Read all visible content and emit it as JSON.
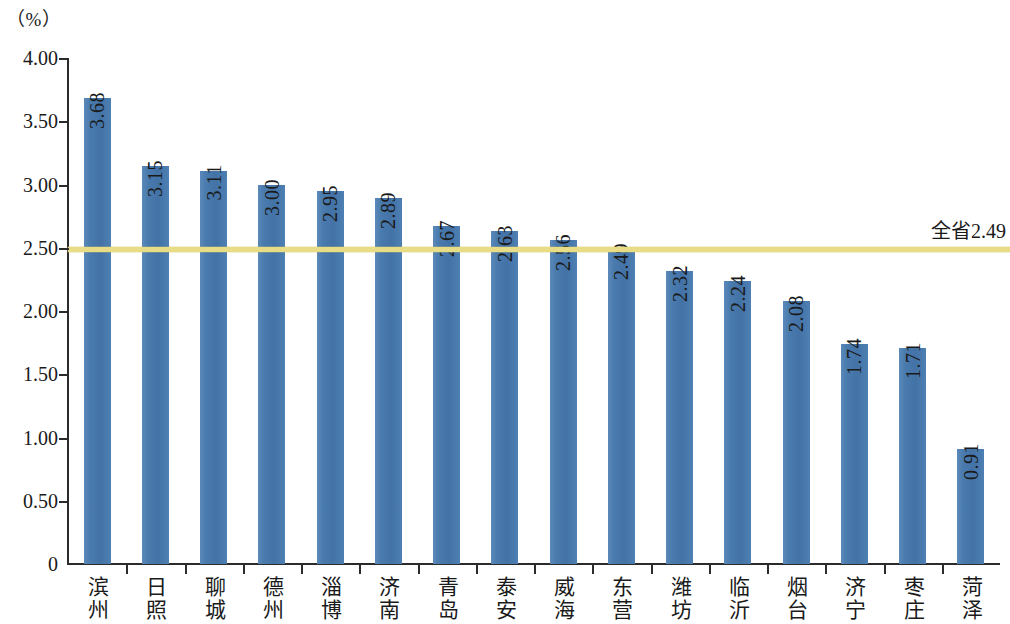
{
  "unit_label": "（%）",
  "average_line": {
    "label": "全省2.49",
    "value": 2.49,
    "color": "#e9dc86"
  },
  "axis": {
    "y_ticks": [
      "4.00",
      "3.50",
      "3.00",
      "2.50",
      "2.00",
      "1.50",
      "1.00",
      "0.50",
      "0"
    ],
    "y_values": [
      4.0,
      3.5,
      3.0,
      2.5,
      2.0,
      1.5,
      1.0,
      0.5,
      0
    ]
  },
  "chart_data": {
    "type": "bar",
    "title": "",
    "subtitle": "",
    "xlabel": "",
    "ylabel": "（%）",
    "ylim": [
      0,
      4.0
    ],
    "ytick_values": [
      0,
      0.5,
      1.0,
      1.5,
      2.0,
      2.5,
      3.0,
      3.5,
      4.0
    ],
    "ytick_labels": [
      "0",
      "0.50",
      "1.00",
      "1.50",
      "2.00",
      "2.50",
      "3.00",
      "3.50",
      "4.00"
    ],
    "grid": false,
    "legend": null,
    "bar_color": "#4a7bae",
    "categories": [
      "滨州",
      "日照",
      "聊城",
      "德州",
      "淄博",
      "济南",
      "青岛",
      "泰安",
      "威海",
      "东营",
      "潍坊",
      "临沂",
      "烟台",
      "济宁",
      "枣庄",
      "菏泽"
    ],
    "values": [
      3.68,
      3.15,
      3.11,
      3.0,
      2.95,
      2.89,
      2.67,
      2.63,
      2.56,
      2.49,
      2.32,
      2.24,
      2.08,
      1.74,
      1.71,
      0.91
    ],
    "value_labels": [
      "3.68",
      "3.15",
      "3.11",
      "3.00",
      "2.95",
      "2.89",
      "2.67",
      "2.63",
      "2.56",
      "2.49",
      "2.32",
      "2.24",
      "2.08",
      "1.74",
      "1.71",
      "0.91"
    ],
    "annotations": [
      {
        "type": "hline",
        "value": 2.49,
        "label": "全省2.49",
        "color": "#e9dc86"
      }
    ]
  }
}
